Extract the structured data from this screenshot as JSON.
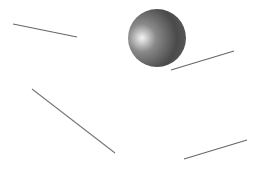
{
  "scene": {
    "width": 266,
    "height": 174,
    "background": "#ffffff",
    "sphere": {
      "cx": 157,
      "cy": 38,
      "r": 29,
      "highlight_cx": 142,
      "highlight_cy": 38,
      "color_light": "#f4f4f4",
      "color_mid": "#8a8a8a",
      "color_dark": "#4a4a4a",
      "color_edge": "#5a5a5a"
    },
    "lines": [
      {
        "x1": 13,
        "y1": 24,
        "x2": 77,
        "y2": 37,
        "color": "#666666"
      },
      {
        "x1": 171,
        "y1": 70,
        "x2": 234,
        "y2": 51,
        "color": "#666666"
      },
      {
        "x1": 32,
        "y1": 89,
        "x2": 115,
        "y2": 153,
        "color": "#777777"
      },
      {
        "x1": 184,
        "y1": 159,
        "x2": 247,
        "y2": 140,
        "color": "#666666"
      }
    ]
  }
}
